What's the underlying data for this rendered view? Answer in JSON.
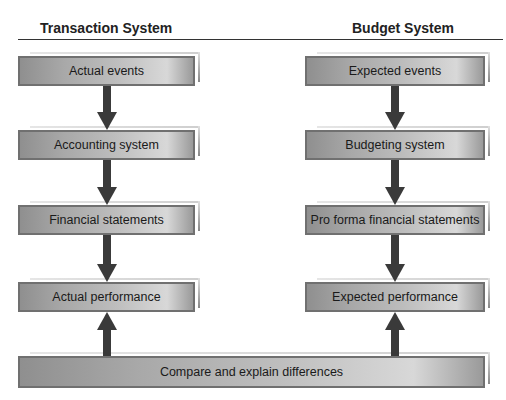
{
  "columns": {
    "left": {
      "title": "Transaction System",
      "boxes": [
        "Actual events",
        "Accounting system",
        "Financial statements",
        "Actual performance"
      ]
    },
    "right": {
      "title": "Budget System",
      "boxes": [
        "Expected events",
        "Budgeting system",
        "Pro forma financial statements",
        "Expected performance"
      ]
    }
  },
  "bottom": {
    "label": "Compare and explain differences"
  },
  "colors": {
    "box_fill": "#b4b4b4",
    "box_border": "#707070",
    "arrow": "#3a3a3a",
    "rule": "#333333"
  }
}
